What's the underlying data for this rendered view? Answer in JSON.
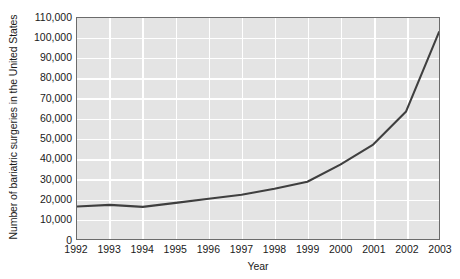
{
  "chart_data": {
    "type": "line",
    "title": "",
    "xlabel": "Year",
    "ylabel": "Number of bariatric surgeries in the United States",
    "x": [
      1992,
      1993,
      1994,
      1995,
      1996,
      1997,
      1998,
      1999,
      2000,
      2001,
      2002,
      2003
    ],
    "categories": [
      "1992",
      "1993",
      "1994",
      "1995",
      "1996",
      "1997",
      "1998",
      "1999",
      "2000",
      "2001",
      "2002",
      "2003"
    ],
    "values": [
      16200,
      17000,
      16000,
      18000,
      20000,
      22000,
      25000,
      28500,
      37000,
      47000,
      63500,
      103000
    ],
    "series": [
      {
        "name": "Bariatric surgeries",
        "values": [
          16200,
          17000,
          16000,
          18000,
          20000,
          22000,
          25000,
          28500,
          37000,
          47000,
          63500,
          103000
        ]
      }
    ],
    "xlim": [
      1992,
      2003
    ],
    "ylim": [
      0,
      110000
    ],
    "ytick_values": [
      0,
      10000,
      20000,
      30000,
      40000,
      50000,
      60000,
      70000,
      80000,
      90000,
      100000,
      110000
    ],
    "ytick_labels": [
      "0",
      "10,000",
      "20,000",
      "30,000",
      "40,000",
      "50,000",
      "60,000",
      "70,000",
      "80,000",
      "90,000",
      "100,000",
      "110,000"
    ],
    "grid": true,
    "grid_color": "#ffffff",
    "plot_background": "#e4e4e4",
    "line_color": "#3f3f3f",
    "legend": false,
    "legend_position": "none"
  }
}
